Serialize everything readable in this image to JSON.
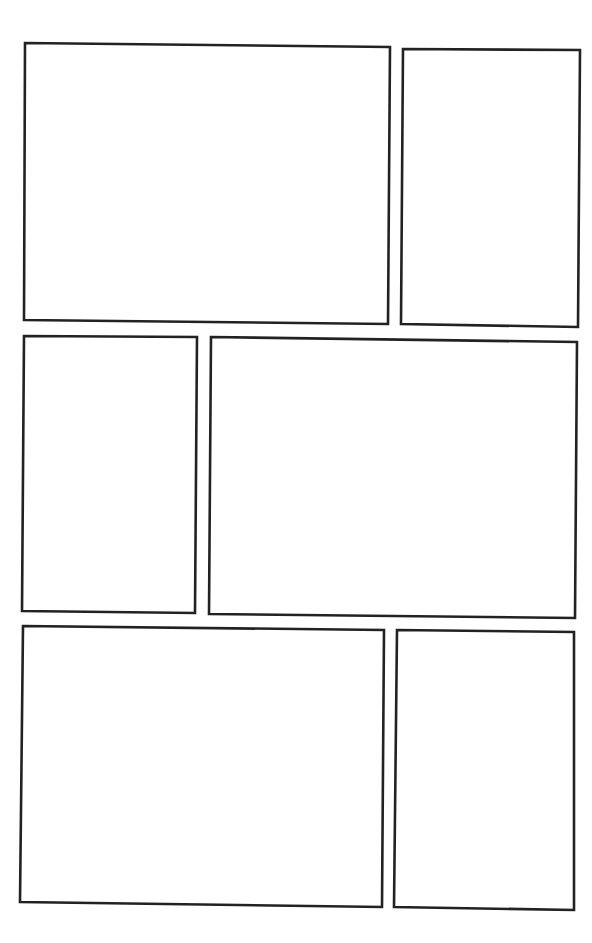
{
  "page": {
    "type": "comic-page-template",
    "background": "#ffffff",
    "border_color": "#222222",
    "panel_count": 6
  },
  "panels": [
    {
      "id": "panel-1",
      "row": 1,
      "position": "left",
      "points": "25,43 390,47 388,324 24,320"
    },
    {
      "id": "panel-2",
      "row": 1,
      "position": "right",
      "points": "403,49 580,50 578,327 401,324"
    },
    {
      "id": "panel-3",
      "row": 2,
      "position": "left",
      "points": "24,336 197,337 195,613 22,611"
    },
    {
      "id": "panel-4",
      "row": 2,
      "position": "right",
      "points": "211,337 577,342 575,618 209,614"
    },
    {
      "id": "panel-5",
      "row": 3,
      "position": "left",
      "points": "23,626 384,630 382,907 20,902"
    },
    {
      "id": "panel-6",
      "row": 3,
      "position": "right",
      "points": "397,630 574,632 574,910 394,907"
    }
  ]
}
